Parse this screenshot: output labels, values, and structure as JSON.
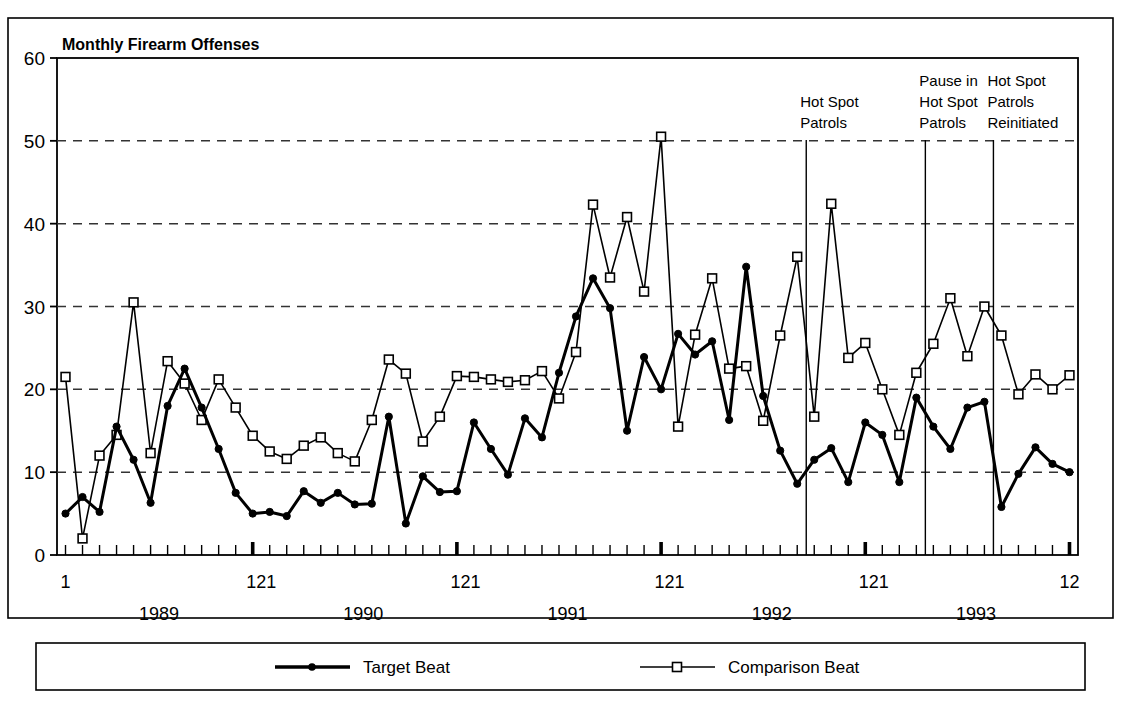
{
  "chart_data": {
    "type": "line",
    "title": "Monthly Firearm Offenses",
    "xlabel": "",
    "ylabel": "",
    "ylim": [
      0,
      60
    ],
    "yticks": [
      0,
      10,
      20,
      30,
      40,
      50,
      60
    ],
    "grid": "horizontal-dashed",
    "legend_position": "bottom",
    "x_axis_note": "60 monthly observations, January 1989 through December 1993",
    "x_tick_labels": [
      "1",
      "121",
      "121",
      "121",
      "121",
      "12"
    ],
    "year_labels": [
      "1989",
      "1990",
      "1991",
      "1992",
      "1993"
    ],
    "categories": [
      "1989-01",
      "1989-02",
      "1989-03",
      "1989-04",
      "1989-05",
      "1989-06",
      "1989-07",
      "1989-08",
      "1989-09",
      "1989-10",
      "1989-11",
      "1989-12",
      "1990-01",
      "1990-02",
      "1990-03",
      "1990-04",
      "1990-05",
      "1990-06",
      "1990-07",
      "1990-08",
      "1990-09",
      "1990-10",
      "1990-11",
      "1990-12",
      "1991-01",
      "1991-02",
      "1991-03",
      "1991-04",
      "1991-05",
      "1991-06",
      "1991-07",
      "1991-08",
      "1991-09",
      "1991-10",
      "1991-11",
      "1991-12",
      "1992-01",
      "1992-02",
      "1992-03",
      "1992-04",
      "1992-05",
      "1992-06",
      "1992-07",
      "1992-08",
      "1992-09",
      "1992-10",
      "1992-11",
      "1992-12",
      "1993-01",
      "1993-02",
      "1993-03",
      "1993-04",
      "1993-05",
      "1993-06",
      "1993-07",
      "1993-08",
      "1993-09",
      "1993-10",
      "1993-11",
      "1993-12"
    ],
    "series": [
      {
        "name": "Target Beat",
        "marker": "filled-circle",
        "line_width": 3,
        "color": "#000000",
        "values": [
          5,
          7,
          5.2,
          15.5,
          11.5,
          6.3,
          18,
          22.5,
          17.8,
          12.8,
          7.5,
          5,
          5.2,
          4.7,
          7.7,
          6.3,
          7.5,
          6.1,
          6.2,
          16.7,
          3.8,
          9.5,
          7.6,
          7.7,
          16,
          12.8,
          9.7,
          16.5,
          14.2,
          22,
          28.8,
          33.4,
          29.8,
          15,
          23.9,
          20,
          26.7,
          24.2,
          25.8,
          16.3,
          34.8,
          19.2,
          12.6,
          8.6,
          11.5,
          12.9,
          8.8,
          16,
          14.5,
          8.8,
          19,
          15.5,
          12.8,
          17.8,
          18.5,
          5.8,
          9.8,
          13,
          11,
          10
        ]
      },
      {
        "name": "Comparison Beat",
        "marker": "open-square",
        "line_width": 1.6,
        "color": "#000000",
        "values": [
          21.5,
          2,
          12,
          14.5,
          30.5,
          12.3,
          23.4,
          20.7,
          16.3,
          21.2,
          17.8,
          14.4,
          12.5,
          11.6,
          13.2,
          14.2,
          12.3,
          11.3,
          16.3,
          23.6,
          21.9,
          13.7,
          16.7,
          21.6,
          21.5,
          21.2,
          20.9,
          21.1,
          22.2,
          18.9,
          24.5,
          42.3,
          33.5,
          40.8,
          31.8,
          50.5,
          15.5,
          26.6,
          33.4,
          22.5,
          22.8,
          16.2,
          26.5,
          36,
          16.7,
          42.4,
          23.8,
          25.6,
          20,
          14.5,
          22,
          25.5,
          31,
          24,
          30,
          26.5,
          19.4,
          21.8,
          20,
          21.7
        ]
      }
    ],
    "annotations": [
      {
        "label_lines": [
          "Hot Spot",
          "Patrols"
        ],
        "at_index": 44
      },
      {
        "label_lines": [
          "Pause in",
          "Hot Spot",
          "Patrols"
        ],
        "at_index": 51
      },
      {
        "label_lines": [
          "Hot Spot",
          "Patrols",
          "Reinitiated"
        ],
        "at_index": 55
      }
    ],
    "colors": {
      "axis": "#000000",
      "grid": "#333333",
      "background": "#ffffff"
    }
  },
  "legend": {
    "items": [
      {
        "label": "Target Beat",
        "marker": "filled-circle"
      },
      {
        "label": "Comparison Beat",
        "marker": "open-square"
      }
    ]
  }
}
